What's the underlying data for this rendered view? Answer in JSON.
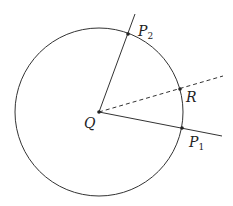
{
  "diagram": {
    "type": "geometry",
    "colors": {
      "stroke": "#333333",
      "background": "#ffffff"
    },
    "circle": {
      "cx": 99,
      "cy": 112,
      "r": 84
    },
    "center": {
      "label": "Q",
      "x": 99,
      "y": 112
    },
    "points": {
      "P1": {
        "label": "P",
        "subscript": "1",
        "x": 182,
        "y": 128
      },
      "P2": {
        "label": "P",
        "subscript": "2",
        "x": 128,
        "y": 34
      },
      "R": {
        "label": "R",
        "x": 180,
        "y": 89
      }
    },
    "rays": [
      {
        "name": "ray-q-p1",
        "from": "Q",
        "to_end": [
          222,
          136
        ],
        "style": "solid"
      },
      {
        "name": "ray-q-p2",
        "from": "Q",
        "to_end": [
          135,
          14
        ],
        "style": "solid"
      },
      {
        "name": "ray-q-r",
        "from": "Q",
        "to_end": [
          223,
          76
        ],
        "style": "dashed"
      }
    ]
  }
}
